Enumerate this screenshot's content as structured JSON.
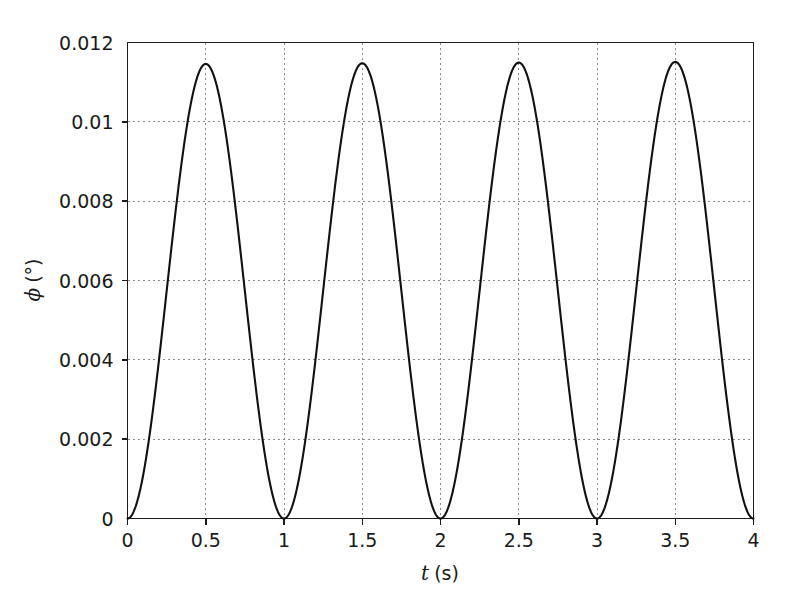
{
  "chart_data": {
    "type": "line",
    "title": "",
    "subtitle": "",
    "xlabel": "t (s)",
    "xlabel_symbol": "t",
    "xlabel_unit": "(s)",
    "ylabel": "ϕ (°)",
    "ylabel_symbol": "ϕ",
    "ylabel_unit": "(°)",
    "xlim": [
      0,
      4
    ],
    "ylim": [
      0,
      0.012
    ],
    "xticks": [
      0,
      0.5,
      1,
      1.5,
      2,
      2.5,
      3,
      3.5,
      4
    ],
    "xtick_labels": [
      "0",
      "0.5",
      "1",
      "1.5",
      "2",
      "2.5",
      "3",
      "3.5",
      "4"
    ],
    "yticks": [
      0,
      0.002,
      0.004,
      0.006,
      0.008,
      0.01,
      0.012
    ],
    "ytick_labels": [
      "0",
      "0.002",
      "0.004",
      "0.006",
      "0.008",
      "0.01",
      "0.012"
    ],
    "grid": true,
    "grid_style": "dotted",
    "grid_color": "#8a8a8a",
    "legend": null,
    "legend_position": "none",
    "line_color": "#111111",
    "background_color": "#ffffff",
    "axis_color": "#1c1c1c",
    "series": [
      {
        "name": "phi(t)",
        "period": 1,
        "amplitude": 0.01148,
        "minimum": 0,
        "peak_times": [
          0.5,
          1.5,
          2.5,
          3.5
        ],
        "peak_values": [
          0.01145,
          0.01147,
          0.0115,
          0.01152
        ],
        "zero_times": [
          0,
          1,
          2,
          3,
          4
        ],
        "x": [
          0,
          0.05,
          0.1,
          0.15,
          0.2,
          0.25,
          0.3,
          0.35,
          0.4,
          0.45,
          0.5,
          0.55,
          0.6,
          0.65,
          0.7,
          0.75,
          0.8,
          0.85,
          0.9,
          0.95,
          1,
          1.05,
          1.1,
          1.15,
          1.2,
          1.25,
          1.3,
          1.35,
          1.4,
          1.45,
          1.5,
          1.55,
          1.6,
          1.65,
          1.7,
          1.75,
          1.8,
          1.85,
          1.9,
          1.95,
          2,
          2.05,
          2.1,
          2.15,
          2.2,
          2.25,
          2.3,
          2.35,
          2.4,
          2.45,
          2.5,
          2.55,
          2.6,
          2.65,
          2.7,
          2.75,
          2.8,
          2.85,
          2.9,
          2.95,
          3,
          3.05,
          3.1,
          3.15,
          3.2,
          3.25,
          3.3,
          3.35,
          3.4,
          3.45,
          3.5,
          3.55,
          3.6,
          3.65,
          3.7,
          3.75,
          3.8,
          3.85,
          3.9,
          3.95,
          4
        ],
        "y": [
          0.0,
          0.00028,
          0.0011,
          0.00239,
          0.00396,
          0.00573,
          0.00749,
          0.00906,
          0.01035,
          0.01117,
          0.01145,
          0.01117,
          0.01035,
          0.00906,
          0.00749,
          0.00573,
          0.00396,
          0.00239,
          0.0011,
          0.00028,
          0.0,
          0.00028,
          0.0011,
          0.00239,
          0.00397,
          0.00574,
          0.0075,
          0.00908,
          0.01037,
          0.01119,
          0.01147,
          0.01119,
          0.01037,
          0.00908,
          0.0075,
          0.00574,
          0.00397,
          0.00239,
          0.0011,
          0.00028,
          0.0,
          0.00028,
          0.0011,
          0.0024,
          0.00398,
          0.00575,
          0.00752,
          0.0091,
          0.01039,
          0.01122,
          0.0115,
          0.01122,
          0.01039,
          0.0091,
          0.00752,
          0.00575,
          0.00398,
          0.0024,
          0.0011,
          0.00028,
          0.0,
          0.00028,
          0.00111,
          0.0024,
          0.00399,
          0.00576,
          0.00753,
          0.00912,
          0.01041,
          0.01124,
          0.01152,
          0.01124,
          0.01041,
          0.00912,
          0.00753,
          0.00576,
          0.00399,
          0.0024,
          0.00111,
          0.00028,
          0.0
        ]
      }
    ]
  }
}
